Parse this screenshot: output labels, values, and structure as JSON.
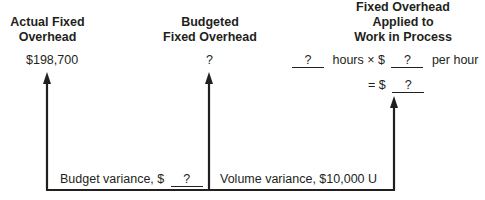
{
  "columns": {
    "actual": {
      "title_line1": "Actual Fixed",
      "title_line2": "Overhead",
      "value": "$198,700"
    },
    "budgeted": {
      "title_line1": "Budgeted",
      "title_line2": "Fixed Overhead",
      "value": "?"
    },
    "applied": {
      "title_line1": "Fixed Overhead",
      "title_line2": "Applied to",
      "title_line3": "Work in Process",
      "hours_blank": "?",
      "hours_text": "hours × $",
      "rate_blank": "?",
      "rate_text": "per hour",
      "equals_text": "= $",
      "total_blank": "?"
    }
  },
  "variances": {
    "budget": {
      "label": "Budget variance, $",
      "blank": "?"
    },
    "volume": {
      "label": "Volume variance, $10,000 U"
    }
  },
  "colors": {
    "ink": "#231f20",
    "background": "#ffffff"
  }
}
